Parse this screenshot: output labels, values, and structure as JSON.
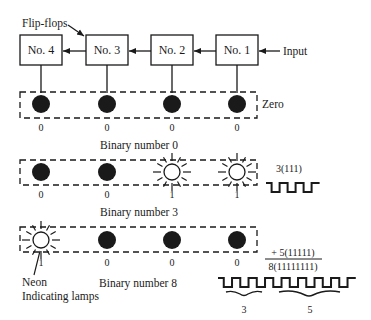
{
  "title_label": "Flip-flops",
  "input_label": "Input",
  "flip_flops": [
    {
      "label": "No. 4"
    },
    {
      "label": "No. 3"
    },
    {
      "label": "No. 2"
    },
    {
      "label": "No. 1"
    }
  ],
  "rows": [
    {
      "side_label": "Zero",
      "caption": "Binary number 0",
      "lamps": [
        {
          "state": "off",
          "digit": "0"
        },
        {
          "state": "off",
          "digit": "0"
        },
        {
          "state": "off",
          "digit": "0"
        },
        {
          "state": "off",
          "digit": "0"
        }
      ]
    },
    {
      "side_label": "3(111)",
      "caption": "Binary number 3",
      "pulse_count": 3,
      "lamps": [
        {
          "state": "off",
          "digit": "0"
        },
        {
          "state": "off",
          "digit": "0"
        },
        {
          "state": "on",
          "digit": "1"
        },
        {
          "state": "on",
          "digit": "1"
        }
      ]
    },
    {
      "caption": "Binary number 8",
      "lamps": [
        {
          "state": "on",
          "digit": "1"
        },
        {
          "state": "off",
          "digit": "0"
        },
        {
          "state": "off",
          "digit": "0"
        },
        {
          "state": "off",
          "digit": "0"
        }
      ],
      "sum": {
        "addend": "+ 5(11111)",
        "total": "8(11111111)"
      },
      "pulse_count": 8,
      "brace_labels": [
        "3",
        "5"
      ],
      "lamp_note_line1": "Neon",
      "lamp_note_line2": "Indicating lamps"
    }
  ],
  "colors": {
    "ink": "#1a1a1a",
    "paper": "#ffffff"
  }
}
